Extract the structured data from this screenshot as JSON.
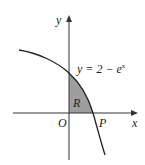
{
  "diagram": {
    "curve_label": "y = 2 − e",
    "curve_exponent": "x",
    "axis_x_label": "x",
    "axis_y_label": "y",
    "origin_label": "O",
    "point_label": "P",
    "region_label": "R",
    "colors": {
      "region_fill": "#9e9e9e",
      "line": "#222222",
      "axis": "#333333"
    }
  }
}
